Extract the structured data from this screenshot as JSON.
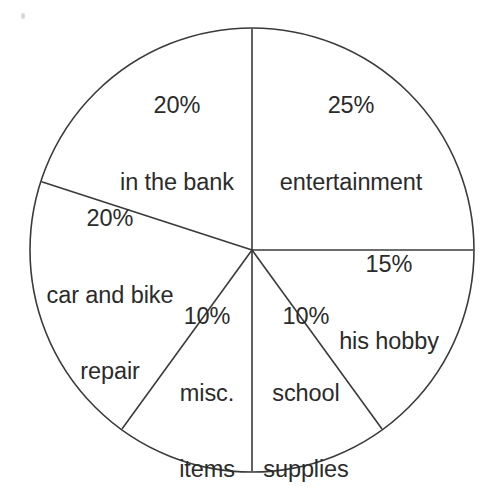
{
  "chart_data": {
    "type": "pie",
    "title": "",
    "subtitle": "",
    "xlabel": "",
    "ylabel": "",
    "legend_position": "none",
    "grid": false,
    "total": 100,
    "units": "percent",
    "start_angle_deg": 0,
    "direction": "clockwise",
    "categories": [
      "entertainment",
      "his hobby",
      "school supplies",
      "misc. items",
      "car and bike repair",
      "in the bank"
    ],
    "values": [
      25,
      15,
      10,
      10,
      20,
      20
    ],
    "value_labels": [
      "25%",
      "15%",
      "10%",
      "10%",
      "20%",
      "20%"
    ],
    "slices": [
      {
        "id": "entertainment",
        "value": 25,
        "percent_label": "25%",
        "name_lines": [
          "entertainment"
        ],
        "start_angle_deg": 0,
        "end_angle_deg": 90,
        "label_x": 351,
        "label_y": 144
      },
      {
        "id": "his-hobby",
        "value": 15,
        "percent_label": "15%",
        "name_lines": [
          "his hobby"
        ],
        "start_angle_deg": 90,
        "end_angle_deg": 144,
        "label_x": 389,
        "label_y": 303
      },
      {
        "id": "school-supplies",
        "value": 10,
        "percent_label": "10%",
        "name_lines": [
          "school",
          "supplies"
        ],
        "start_angle_deg": 144,
        "end_angle_deg": 180,
        "label_x": 306,
        "label_y": 393
      },
      {
        "id": "misc-items",
        "value": 10,
        "percent_label": "10%",
        "name_lines": [
          "misc.",
          "items"
        ],
        "start_angle_deg": 180,
        "end_angle_deg": 216,
        "label_x": 207,
        "label_y": 393
      },
      {
        "id": "car-and-bike-repair",
        "value": 20,
        "percent_label": "20%",
        "name_lines": [
          "car and bike",
          "repair"
        ],
        "start_angle_deg": 216,
        "end_angle_deg": 288,
        "label_x": 110,
        "label_y": 295
      },
      {
        "id": "in-the-bank",
        "value": 20,
        "percent_label": "20%",
        "name_lines": [
          "in the bank"
        ],
        "start_angle_deg": 288,
        "end_angle_deg": 360,
        "label_x": 177,
        "label_y": 144
      }
    ],
    "geometry": {
      "center_x": 252,
      "center_y": 250,
      "radius": 222
    },
    "style": {
      "background_color": "#ffffff",
      "stroke_color": "#3a3a3a",
      "slice_fill_color": "#ffffff",
      "text_color": "#2b2b2b",
      "stroke_width": 1.6
    }
  },
  "labels": {
    "entertainment": {
      "percent": "25%",
      "line1": "entertainment"
    },
    "his_hobby": {
      "percent": "15%",
      "line1": "his hobby"
    },
    "school_supplies": {
      "percent": "10%",
      "line1": "school",
      "line2": "supplies"
    },
    "misc_items": {
      "percent": "10%",
      "line1": "misc.",
      "line2": "items"
    },
    "car_and_bike_repair": {
      "percent": "20%",
      "line1": "car and bike",
      "line2": "repair"
    },
    "in_the_bank": {
      "percent": "20%",
      "line1": "in the bank"
    }
  }
}
